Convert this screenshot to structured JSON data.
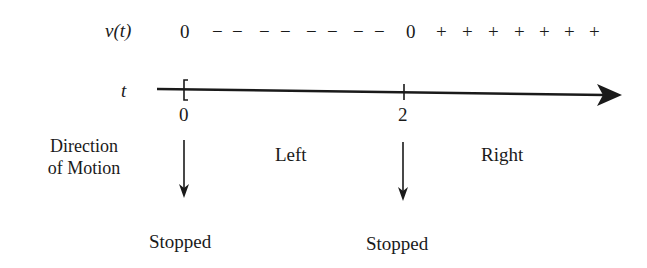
{
  "sign_row": {
    "label": "v(t)",
    "zero_left": "0",
    "negative_signs": [
      "−",
      "−",
      "−",
      "−",
      "−",
      "−",
      "−",
      "−"
    ],
    "zero_right": "0",
    "positive_signs": [
      "+",
      "+",
      "+",
      "+",
      "+",
      "+",
      "+"
    ]
  },
  "axis": {
    "label": "t",
    "ticks": [
      {
        "value": "0",
        "x": 184
      },
      {
        "value": "2",
        "x": 404
      }
    ],
    "color": "#1a1a1a"
  },
  "direction": {
    "heading_line1": "Direction",
    "heading_line2": "of Motion",
    "intervals": [
      {
        "label": "Left"
      },
      {
        "label": "Right"
      }
    ],
    "stops": [
      {
        "label": "Stopped"
      },
      {
        "label": "Stopped"
      }
    ]
  }
}
